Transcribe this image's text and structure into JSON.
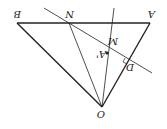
{
  "diagram": {
    "orientation": "rotated 180 degrees",
    "labels": {
      "A": "A",
      "B": "B",
      "N": "N",
      "O": "O",
      "M": "M",
      "A_prime": "A'",
      "D": "D"
    },
    "colors": {
      "stroke": "#222222",
      "background": "#ffffff"
    }
  }
}
